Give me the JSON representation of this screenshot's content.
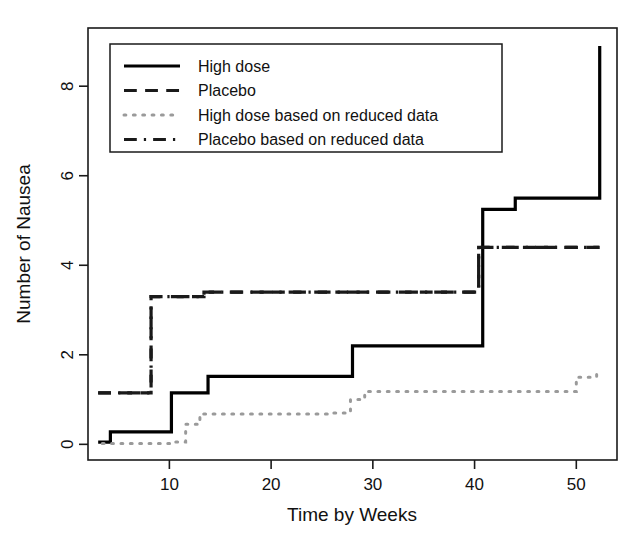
{
  "chart_data": {
    "type": "line",
    "title": "",
    "xlabel": "Time by Weeks",
    "ylabel": "Number of Nausea",
    "xlim": [
      2,
      54
    ],
    "ylim": [
      -0.35,
      9.3
    ],
    "xticks": [
      10,
      20,
      30,
      40,
      50
    ],
    "yticks": [
      0,
      2,
      4,
      6,
      8
    ],
    "xtick_labels": [
      "10",
      "20",
      "30",
      "40",
      "50"
    ],
    "ytick_labels": [
      "0",
      "2",
      "4",
      "6",
      "8"
    ],
    "grid": false,
    "legend_position": "top-left",
    "step_type": "post",
    "series": [
      {
        "name": "High dose",
        "style": "solid",
        "color": "#000000",
        "width": 3.2,
        "x": [
          3.0,
          4.2,
          9.4,
          10.2,
          11.4,
          13.8,
          28.0,
          40.8,
          44.0,
          52.3,
          52.3
        ],
        "y": [
          0.05,
          0.28,
          0.28,
          1.15,
          1.15,
          1.52,
          2.2,
          5.25,
          5.5,
          5.5,
          8.9
        ]
      },
      {
        "name": "Placebo",
        "style": "dashed",
        "color": "#1a1a1a",
        "width": 3.2,
        "x": [
          3.0,
          7.3,
          8.2,
          13.4,
          40.4,
          52.3
        ],
        "y": [
          1.15,
          1.15,
          3.3,
          3.4,
          4.4,
          4.4
        ]
      },
      {
        "name": "High dose based on reduced data",
        "style": "dotted",
        "color": "#9a9a9a",
        "width": 3.0,
        "x": [
          3.4,
          10.2,
          11.6,
          13.0,
          25.8,
          27.8,
          29.2,
          48.6,
          50.0,
          52.0
        ],
        "y": [
          0.02,
          0.05,
          0.45,
          0.68,
          0.7,
          1.0,
          1.18,
          1.18,
          1.5,
          1.63
        ]
      },
      {
        "name": "Placebo based on reduced data",
        "style": "dashdot",
        "color": "#1a1a1a",
        "width": 3.2,
        "x": [
          3.0,
          7.3,
          8.2,
          13.4,
          40.4,
          52.3
        ],
        "y": [
          1.15,
          1.15,
          3.3,
          3.4,
          4.4,
          4.4
        ]
      }
    ]
  },
  "legend": {
    "items": [
      {
        "label": "High dose",
        "sample": "solid"
      },
      {
        "label": "Placebo",
        "sample": "dashed"
      },
      {
        "label": "High dose based on reduced data",
        "sample": "dotted"
      },
      {
        "label": "Placebo based on reduced data",
        "sample": "dashdot"
      }
    ]
  },
  "axes": {
    "x_title": "Time by Weeks",
    "y_title": "Number of Nausea",
    "x_ticks": [
      "10",
      "20",
      "30",
      "40",
      "50"
    ],
    "y_ticks": [
      "0",
      "2",
      "4",
      "6",
      "8"
    ]
  },
  "colors": {
    "ink": "#000000",
    "faint": "#9a9a9a",
    "frame": "#1a1a1a",
    "background": "#ffffff"
  }
}
